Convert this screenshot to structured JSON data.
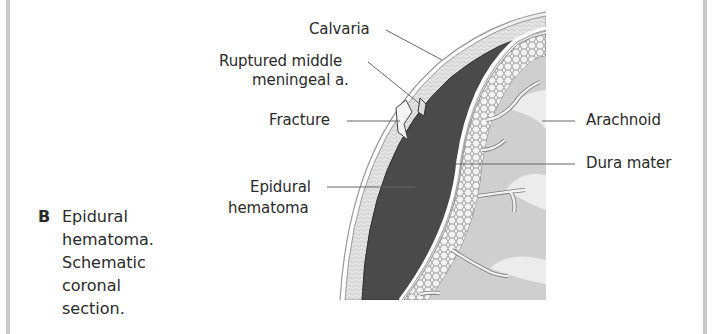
{
  "figure": {
    "caption_letter": "B",
    "caption_lines": [
      "Epidural",
      "hematoma.",
      "Schematic",
      "coronal section."
    ],
    "labels": {
      "calvaria": "Calvaria",
      "ruptured_line1": "Ruptured middle",
      "ruptured_line2": "meningeal a.",
      "fracture": "Fracture",
      "epidural_line1": "Epidural",
      "epidural_line2": "hematoma",
      "arachnoid": "Arachnoid",
      "dura_mater": "Dura mater"
    },
    "colors": {
      "side_bar": "#c9c9c9",
      "hematoma": "#4a4a4a",
      "bone": "#e6e6e6",
      "cortex": "#cfcfcf",
      "white_matter": "#ececec",
      "leader_line": "#666666"
    }
  }
}
